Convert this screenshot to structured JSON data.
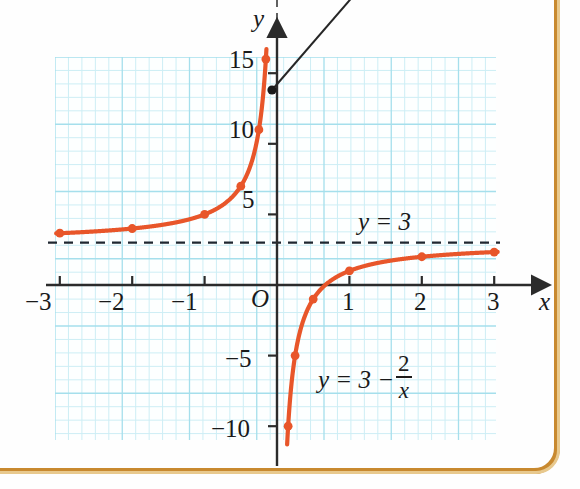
{
  "figure": {
    "kind": "coordinate-graph",
    "axis_x_label": "x",
    "axis_y_label": "y",
    "origin_label": "O",
    "asymptote_label": "y = 3",
    "curve_label_prefix": "y = 3 −",
    "curve_label_numerator": "2",
    "curve_label_denominator": "x"
  },
  "axes": {
    "x_ticks": [
      {
        "value": -3,
        "label": "−3"
      },
      {
        "value": -2,
        "label": "−2"
      },
      {
        "value": -1,
        "label": "−1"
      },
      {
        "value": 1,
        "label": "1"
      },
      {
        "value": 2,
        "label": "2"
      },
      {
        "value": 3,
        "label": "3"
      }
    ],
    "y_ticks": [
      {
        "value": 15,
        "label": "15"
      },
      {
        "value": 10,
        "label": "10"
      },
      {
        "value": 5,
        "label": "5"
      },
      {
        "value": -5,
        "label": "−5"
      },
      {
        "value": -10,
        "label": "−10"
      }
    ]
  },
  "colors": {
    "curve": "#e8562a",
    "grid": "#bce9f2",
    "axis": "#2b2b2b",
    "asymptote": "#1f2730",
    "page_border": "#c8892f",
    "page_border_light": "#e8c98e",
    "text": "#1a1a1a"
  },
  "chart_data": {
    "type": "line",
    "title": "",
    "xlabel": "x",
    "ylabel": "y",
    "xlim": [
      -3.3,
      3.4
    ],
    "ylim": [
      -10.6,
      16.5
    ],
    "grid": true,
    "grid_step_x": 0.1857,
    "grid_step_y": 0.957,
    "legend": "none",
    "equation": "y = 3 - 2/x",
    "asymptotes": [
      {
        "type": "horizontal",
        "value": 3,
        "label": "y = 3",
        "style": "dashed"
      },
      {
        "type": "vertical",
        "value": 0,
        "label": "",
        "style": "dashed"
      }
    ],
    "xtick_values": [
      -3,
      -2,
      -1,
      0,
      1,
      2,
      3
    ],
    "xtick_labels": [
      "−3",
      "−2",
      "−1",
      "O",
      "1",
      "2",
      "3"
    ],
    "ytick_values": [
      15,
      10,
      5,
      -5,
      -10
    ],
    "ytick_labels": [
      "15",
      "10",
      "5",
      "−5",
      "−10"
    ],
    "series": [
      {
        "name": "left branch (x < 0)",
        "marked_points": [
          {
            "x": -3,
            "y": 3.667
          },
          {
            "x": -2,
            "y": 4
          },
          {
            "x": -1,
            "y": 5
          },
          {
            "x": -0.5,
            "y": 7
          },
          {
            "x": -0.25,
            "y": 11
          },
          {
            "x": -0.1538,
            "y": 16
          }
        ]
      },
      {
        "name": "right branch (x > 0)",
        "marked_points": [
          {
            "x": 0.1538,
            "y": -10
          },
          {
            "x": 0.25,
            "y": -5
          },
          {
            "x": 0.5,
            "y": -1
          },
          {
            "x": 1,
            "y": 1
          },
          {
            "x": 2,
            "y": 2
          },
          {
            "x": 3,
            "y": 2.333
          }
        ]
      }
    ],
    "annotations": [
      {
        "text": "y = 3",
        "x": 1.35,
        "y": 4.0
      },
      {
        "text": "y = 3 - 2/x",
        "x": 0.75,
        "y": -5.7
      }
    ],
    "leader_line": {
      "from_x": -0.07,
      "from_y": 13.0,
      "direction": "up-right, exits frame",
      "marker": "filled-dot"
    }
  }
}
